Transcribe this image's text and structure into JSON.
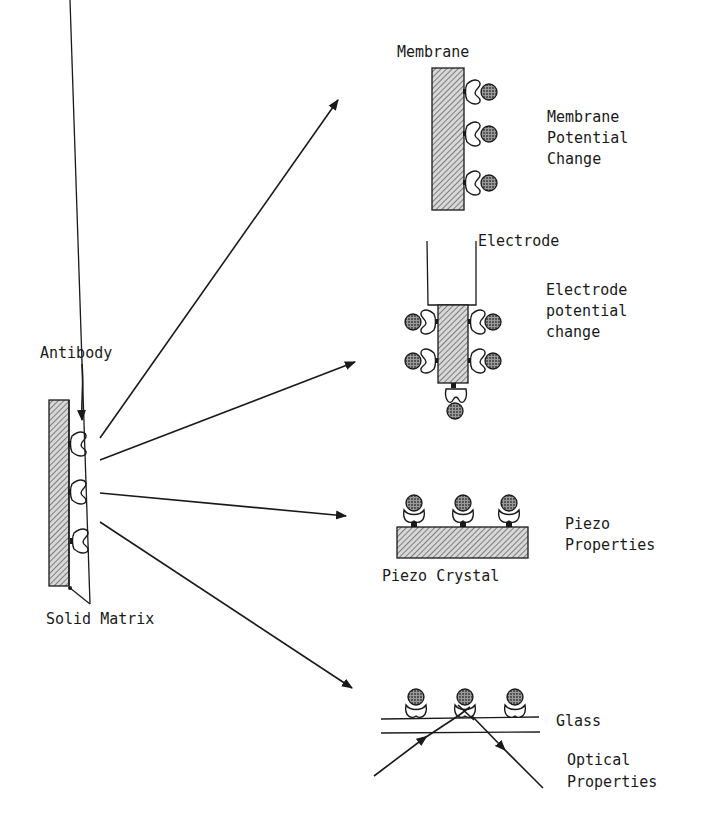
{
  "diagram": {
    "type": "biosensor transduction schematic",
    "source": {
      "antibody_label": "Antibody",
      "matrix_label": "Solid Matrix"
    },
    "panels": [
      {
        "id": "membrane",
        "component_label": "Membrane",
        "property_lines": [
          "Membrane",
          "Potential",
          "Change"
        ]
      },
      {
        "id": "electrode",
        "component_label": "Electrode",
        "property_lines": [
          "Electrode",
          "potential",
          "change"
        ]
      },
      {
        "id": "piezo",
        "component_label": "Piezo Crystal",
        "property_lines": [
          "Piezo",
          "Properties"
        ]
      },
      {
        "id": "optical",
        "component_label": "Glass",
        "property_lines": [
          "Optical",
          "Properties"
        ]
      }
    ],
    "colors": {
      "ink": "#1a1a1a",
      "background": "#ffffff"
    }
  }
}
